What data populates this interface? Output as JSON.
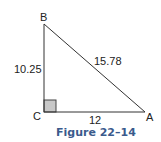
{
  "figure": {
    "caption": "Figure 22–14",
    "caption_color": "#3a5a8c",
    "vertices": {
      "B": {
        "label": "B"
      },
      "C": {
        "label": "C"
      },
      "A": {
        "label": "A"
      }
    },
    "sides": {
      "BC": "10.25",
      "AB": "15.78",
      "CA": "12"
    },
    "right_angle_fill": "#c8c8c8"
  }
}
